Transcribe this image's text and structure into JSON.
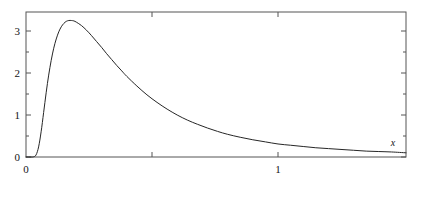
{
  "chart_data": {
    "type": "line",
    "title": "",
    "subtitle": "",
    "xlabel": "x",
    "ylabel": "",
    "xlim": [
      0,
      1.5079
    ],
    "ylim": [
      0,
      3.4524
    ],
    "grid": false,
    "legend": null,
    "line_color": "#262626",
    "frame_color": "#555555",
    "background": "#ffffff",
    "x_ticks_major": [
      0,
      1
    ],
    "x_ticklabels_major": [
      "0",
      "1"
    ],
    "x_ticks_minor": [
      0.5
    ],
    "y_ticks_major": [
      0,
      1,
      2,
      3
    ],
    "y_ticklabels_major": [
      "0",
      "1",
      "2",
      "3"
    ],
    "y_ticks_minor": [
      0.5,
      1.5,
      2.5
    ],
    "peak": {
      "x": 0.19,
      "y": 3.24
    },
    "x": [
      0.0,
      0.01,
      0.02,
      0.03,
      0.04,
      0.05,
      0.06,
      0.07,
      0.08,
      0.09,
      0.1,
      0.11,
      0.12,
      0.13,
      0.14,
      0.15,
      0.16,
      0.17,
      0.18,
      0.19,
      0.2,
      0.22,
      0.24,
      0.26,
      0.28,
      0.3,
      0.32,
      0.34,
      0.36,
      0.38,
      0.4,
      0.44,
      0.48,
      0.52,
      0.56,
      0.6,
      0.64,
      0.68,
      0.72,
      0.76,
      0.8,
      0.85,
      0.9,
      0.95,
      1.0,
      1.05,
      1.1,
      1.15,
      1.2,
      1.25,
      1.3,
      1.35,
      1.4,
      1.45,
      1.5079
    ],
    "y": [
      0.0,
      0.0,
      0.0,
      0.004,
      0.05,
      0.24,
      0.6,
      1.06,
      1.53,
      1.95,
      2.3,
      2.59,
      2.81,
      2.98,
      3.1,
      3.18,
      3.23,
      3.25,
      3.25,
      3.24,
      3.21,
      3.13,
      3.02,
      2.89,
      2.75,
      2.61,
      2.46,
      2.32,
      2.18,
      2.05,
      1.92,
      1.69,
      1.48,
      1.3,
      1.14,
      1.0,
      0.88,
      0.78,
      0.69,
      0.61,
      0.54,
      0.47,
      0.41,
      0.36,
      0.31,
      0.28,
      0.25,
      0.22,
      0.2,
      0.18,
      0.16,
      0.14,
      0.13,
      0.12,
      0.1
    ]
  },
  "axis_label_x": "x",
  "labels": {
    "x_zero": "0",
    "y_zero": "0",
    "x_one": "1",
    "y_one": "1",
    "y_two": "2",
    "y_three": "3"
  }
}
